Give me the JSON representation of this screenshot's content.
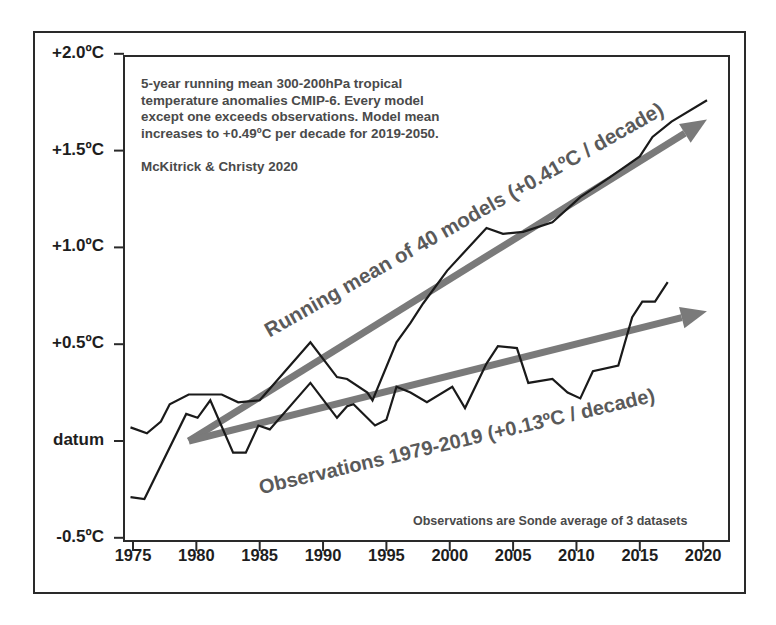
{
  "chart_data": {
    "type": "line",
    "title": "5-year running mean 300-200hPa tropical temperature anomalies CMIP-6",
    "annotation_lines": [
      "5-year running mean 300-200hPa tropical",
      "temperature anomalies CMIP-6.  Every model",
      "except one exceeds observations.  Model mean",
      "increases to +0.49ºC per decade for 2019-2050."
    ],
    "citation": "McKitrick & Christy 2020",
    "footnote": "Observations are Sonde average of 3 datasets",
    "xlabel": "",
    "ylabel": "",
    "xlim": [
      1975,
      2020
    ],
    "ylim": [
      -0.5,
      2.0
    ],
    "grid": false,
    "x_ticks": [
      "1975",
      "1980",
      "1985",
      "1990",
      "1995",
      "2000",
      "2005",
      "2010",
      "2015",
      "2020"
    ],
    "y_ticks": [
      {
        "value": 2.0,
        "label": "+2.0ºC"
      },
      {
        "value": 1.5,
        "label": "+1.5ºC"
      },
      {
        "value": 1.0,
        "label": "+1.0ºC"
      },
      {
        "value": 0.5,
        "label": "+0.5ºC"
      },
      {
        "value": 0.0,
        "label": "datum"
      },
      {
        "value": -0.5,
        "label": "-0.5ºC"
      }
    ],
    "series": [
      {
        "name": "Running mean of 40 models",
        "color": "#1a1a1a",
        "x": [
          1974.8,
          1976.1,
          1977.2,
          1977.9,
          1979.4,
          1982.0,
          1983.3,
          1985.0,
          1985.8,
          1989.0,
          1991.1,
          1991.9,
          1993.5,
          1993.9,
          1995.8,
          1996.9,
          1997.9,
          1999.8,
          2002.9,
          2004.2,
          2005.8,
          2008.1,
          2010.3,
          2012.6,
          2015.0,
          2016.0,
          2017.5,
          2020.3
        ],
        "values": [
          0.07,
          0.04,
          0.1,
          0.19,
          0.24,
          0.24,
          0.2,
          0.21,
          0.27,
          0.51,
          0.33,
          0.32,
          0.25,
          0.21,
          0.51,
          0.61,
          0.71,
          0.88,
          1.1,
          1.07,
          1.08,
          1.13,
          1.26,
          1.36,
          1.47,
          1.57,
          1.65,
          1.76
        ]
      },
      {
        "name": "Observations 1979-2019",
        "color": "#1a1a1a",
        "x": [
          1974.8,
          1975.9,
          1979.2,
          1980.1,
          1981.1,
          1982.9,
          1983.9,
          1984.9,
          1985.8,
          1989.0,
          1991.1,
          1991.9,
          1992.4,
          1994.1,
          1995.0,
          1995.8,
          1996.9,
          1998.2,
          2000.2,
          2001.2,
          2002.9,
          2003.8,
          2005.3,
          2006.2,
          2008.1,
          2009.3,
          2010.3,
          2011.3,
          2013.3,
          2014.4,
          2015.2,
          2016.2,
          2017.2
        ],
        "values": [
          -0.29,
          -0.3,
          0.14,
          0.12,
          0.21,
          -0.06,
          -0.06,
          0.08,
          0.06,
          0.3,
          0.12,
          0.18,
          0.19,
          0.08,
          0.11,
          0.28,
          0.25,
          0.2,
          0.28,
          0.17,
          0.4,
          0.49,
          0.48,
          0.3,
          0.32,
          0.25,
          0.22,
          0.36,
          0.39,
          0.64,
          0.72,
          0.72,
          0.82
        ]
      }
    ],
    "trend_arrows": [
      {
        "name": "Running mean of 40 models (+0.41ºC / decade)",
        "color": "#7a7a7a",
        "x": [
          1979.4,
          2020.3
        ],
        "values": [
          0.0,
          1.66
        ]
      },
      {
        "name": "Observations 1979-2019 (+0.13ºC / decade)",
        "color": "#7a7a7a",
        "x": [
          1979.4,
          2020.3
        ],
        "values": [
          0.0,
          0.67
        ]
      }
    ],
    "trend_labels": {
      "model": "Running mean of 40 models (+0.41ºC / decade)",
      "obs": "Observations 1979-2019 (+0.13ºC / decade)"
    }
  }
}
